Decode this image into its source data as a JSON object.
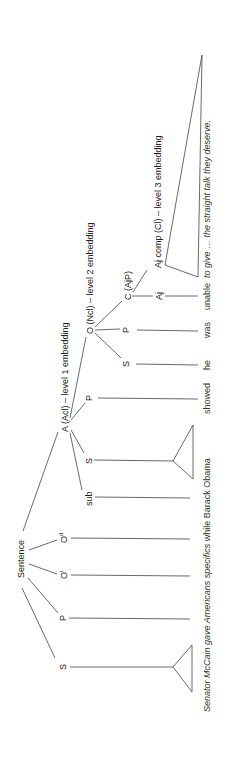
{
  "diagram": {
    "root": {
      "label": "Sentence"
    },
    "main_clause": [
      {
        "id": "S",
        "label": "S",
        "leaf": "triangle"
      },
      {
        "id": "P",
        "label": "P"
      },
      {
        "id": "Oi",
        "label": "O",
        "sup": "i"
      },
      {
        "id": "Od",
        "label": "O",
        "sup": "d"
      }
    ],
    "adverbial": {
      "label": "A (Acl) – level 1 embedding",
      "children": [
        {
          "id": "sub",
          "label": "sub"
        },
        {
          "id": "S",
          "label": "S",
          "leaf": "triangle"
        },
        {
          "id": "P",
          "label": "P"
        }
      ]
    },
    "object_clause": {
      "label": "O (Ncl) – level 2 embedding",
      "children": [
        {
          "id": "S",
          "label": "S"
        },
        {
          "id": "P",
          "label": "P"
        }
      ]
    },
    "complement": {
      "label": "C (AjP)",
      "children": [
        {
          "id": "Aj",
          "label": "Aj"
        },
        {
          "id": "Ajcomp",
          "label": "Aj comp (Cl) – level 3 embedding",
          "leaf": "triangle"
        }
      ]
    },
    "sentence_text": {
      "italic_part": "Senator McCain gave Americans specifics",
      "roman_part": " while Barack Obama",
      "words": [
        "showed",
        "he",
        "was",
        "unable"
      ],
      "tail_italic": "to give … the straight talk they deserve."
    }
  }
}
